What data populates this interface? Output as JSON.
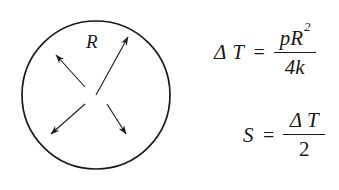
{
  "figure": {
    "background_color": "#ffffff",
    "ink_color": "#1a1a1a"
  },
  "diagram": {
    "shape": "circle",
    "center": {
      "x": 96,
      "y": 95
    },
    "radius": 74,
    "radius_label": "R",
    "arrow_count": 4,
    "arrow_direction": "outward-from-center",
    "arrows": [
      {
        "name": "radius-arrow-upper-right",
        "from": {
          "x": 96,
          "y": 95
        },
        "to": {
          "x": 131,
          "y": 32
        },
        "labeled": true
      },
      {
        "name": "arrow-upper-left",
        "from": {
          "x": 85,
          "y": 87
        },
        "to": {
          "x": 52,
          "y": 51
        },
        "labeled": false
      },
      {
        "name": "arrow-lower-left",
        "from": {
          "x": 85,
          "y": 104
        },
        "to": {
          "x": 47,
          "y": 138
        },
        "labeled": false
      },
      {
        "name": "arrow-lower-right",
        "from": {
          "x": 107,
          "y": 104
        },
        "to": {
          "x": 129,
          "y": 139
        },
        "labeled": false
      }
    ]
  },
  "equations": [
    {
      "id": "equation-1",
      "lhs": "Δ T",
      "relation": "=",
      "numerator_base": "pR",
      "numerator_exponent": "2",
      "denominator": "4k",
      "plain": "ΔT = pR² / 4k"
    },
    {
      "id": "equation-2",
      "lhs": "S",
      "relation": "=",
      "numerator": "Δ T",
      "denominator": "2",
      "plain": "S = ΔT / 2"
    }
  ]
}
